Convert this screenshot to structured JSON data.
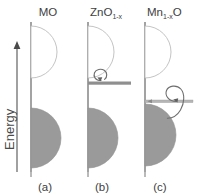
{
  "figure": {
    "width": 205,
    "height": 196,
    "background": "#ffffff",
    "axis": {
      "label": "Energy",
      "arrow_direction": "up",
      "arrow_icon": "up-arrow-icon"
    },
    "colors": {
      "band_fill": "#9a9a9a",
      "band_outline": "#b4b4b4",
      "conduction_fill": "#ffffff",
      "axis_line": "#8c8c8c",
      "defect_bar": "#8f8f8f",
      "defect_bar_light": "#bdbdbd",
      "arrow_stroke": "#6e6e6e",
      "text": "#404040"
    },
    "panels": [
      {
        "id": "a",
        "caption": "(a)",
        "title_main": "MO",
        "title_sub": "",
        "title_tail": "",
        "has_defect_band": false,
        "has_electron_loop": false,
        "description": "Pristine MO band structure: empty conduction band above, filled valence band below, no gap states"
      },
      {
        "id": "b",
        "caption": "(b)",
        "title_main": "ZnO",
        "title_sub": "1-x",
        "title_tail": "",
        "has_defect_band": true,
        "has_electron_loop": true,
        "defect_band_level": "shallow-donor-near-conduction-band",
        "loop_size": "small",
        "description": "Oxygen-deficient ZnO: shallow donor defect band just below the conduction band with a localized electron loop"
      },
      {
        "id": "c",
        "caption": "(c)",
        "title_main": "Mn",
        "title_sub": "1-x",
        "title_tail": "O",
        "has_defect_band": true,
        "has_electron_loop": true,
        "defect_band_level": "deep-acceptor-near-valence-band",
        "loop_size": "large",
        "description": "Cation-deficient MnO: acceptor defect band overlapping the top of the valence band with a larger hole loop"
      }
    ]
  }
}
